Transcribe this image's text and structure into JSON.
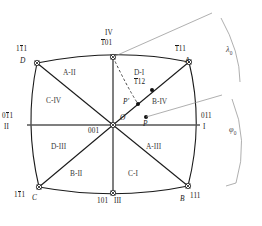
{
  "figure": {
    "type": "standard-stereographic-projection-unit-triangle-map",
    "title": "",
    "colors": {
      "outline": "#1a1a1a",
      "axis": "#555555",
      "arc": "#888888",
      "text": "#1a1a1a",
      "region_text": "#3a3a3a",
      "greek": "#4a4a4a",
      "background": "#ffffff"
    }
  },
  "poles": {
    "top_left": {
      "miller_pre": "1",
      "miller_bar1": "1",
      "miller_post": "1",
      "letter": "D"
    },
    "top": {
      "roman": "IV",
      "miller_bar": "1",
      "miller_post": "01"
    },
    "top_right": {
      "miller_bar": "1",
      "miller_post": "11",
      "letter": "A"
    },
    "left": {
      "miller_pre": "0",
      "miller_bar": "1",
      "miller_post": "1",
      "roman": "II"
    },
    "right": {
      "miller": "011",
      "roman": "I"
    },
    "bottom_left": {
      "miller_pre": "1",
      "miller_bar": "1",
      "miller_post": "1",
      "letter": "C"
    },
    "bottom": {
      "miller": "101",
      "roman": "III"
    },
    "bottom_right": {
      "letter": "B",
      "miller": "111"
    },
    "center": {
      "miller": "001",
      "origin_label": "O"
    }
  },
  "points": {
    "p": {
      "label": "P"
    },
    "p_prime": {
      "label": "P'"
    },
    "pole_d1": {
      "region": "D-I",
      "miller_bar": "1",
      "miller_post": "12"
    }
  },
  "regions": [
    {
      "id": "A-II",
      "label": "A-II"
    },
    {
      "id": "C-IV",
      "label": "C-IV"
    },
    {
      "id": "D-III",
      "label": "D-III"
    },
    {
      "id": "B-II",
      "label": "B-II"
    },
    {
      "id": "C-I",
      "label": "C-I"
    },
    {
      "id": "A-III",
      "label": "A-III"
    },
    {
      "id": "B-IV",
      "label": "B-IV"
    }
  ],
  "angles": {
    "lambda": {
      "glyph": "λ",
      "subscript": "0"
    },
    "phi": {
      "glyph": "φ",
      "subscript": "0"
    }
  }
}
